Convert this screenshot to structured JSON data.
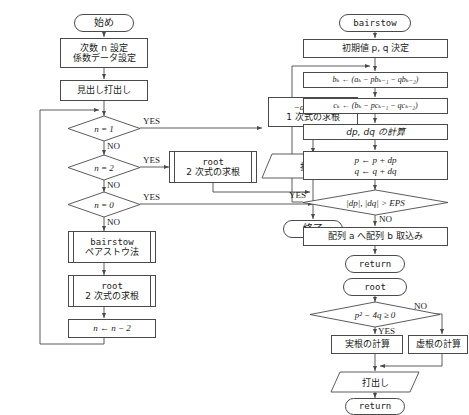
{
  "diagram": {
    "stroke_color": "#4a4a4a",
    "background": "#ffffff"
  },
  "main_chart": {
    "start": "始め",
    "setup_line1": "次数 n 設定",
    "setup_line2": "係数データ設定",
    "header_print": "見出し打出し",
    "decision_n1": "n = 1",
    "decision_n2": "n = 2",
    "decision_n0": "n = 0",
    "yes": "YES",
    "no": "NO",
    "linear_line1": "−a(1)/a(0)",
    "linear_line2": "1 次式の求根",
    "root_call_line1": "root",
    "root_call_line2": "2 次式の求根",
    "print": "打出し",
    "end": "終了",
    "bairstow_call_line1": "bairstow",
    "bairstow_call_line2": "ペアストウ法",
    "root_call2_line1": "root",
    "root_call2_line2": "2 次式の求根",
    "decrement": "n ← n − 2"
  },
  "bairstow_chart": {
    "start": "bairstow",
    "init": "初期値 p, q 決定",
    "formula_b": "bₖ ← (aₖ − pbₖ₋₁ − qbₖ₋₂)",
    "formula_c": "cₖ ← (bₖ − pcₖ₋₁ − qcₖ₋₂)",
    "calc_dpdq": "dp, dq の計算",
    "update_p": "p ← p + dp",
    "update_q": "q ← q + dq",
    "condition": "|dp|, |dq| > EPS",
    "yes": "YES",
    "no": "NO",
    "copy_array": "配列 a へ配列 b 取込み",
    "return": "return"
  },
  "root_chart": {
    "start": "root",
    "discriminant": "p² − 4q ≥ 0",
    "yes": "YES",
    "no": "NO",
    "real_roots": "実根の計算",
    "imaginary_roots": "虚根の計算",
    "print": "打出し",
    "return": "return"
  }
}
